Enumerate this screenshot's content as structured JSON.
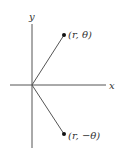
{
  "diagram": {
    "axes": {
      "x_label": "x",
      "y_label": "y"
    },
    "points": [
      {
        "label": "(r, θ)",
        "x": 64,
        "y": 35
      },
      {
        "label": "(r, −θ)",
        "x": 64,
        "y": 134
      }
    ],
    "origin": {
      "x": 32,
      "y": 85
    },
    "colors": {
      "line": "#555555",
      "point": "#111111",
      "text": "#333333"
    }
  }
}
